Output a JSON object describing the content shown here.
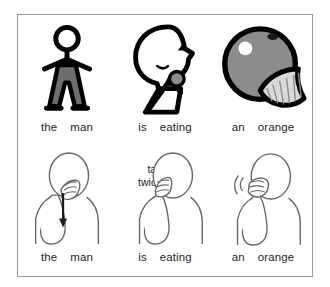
{
  "figure": {
    "border_color": "#9a9a9a",
    "background": "#ffffff"
  },
  "palette": {
    "ink": "#000000",
    "text": "#231f20",
    "body_fill": "#6e6e6e",
    "orange_fill": "#8c8c8c",
    "highlight": "#ffffff",
    "segment_fill": "#d9d9d9",
    "sign_line": "#6b6560"
  },
  "pictogram_row": {
    "cells": [
      {
        "name": "man-pictogram",
        "alt": "stick figure of a standing man with gray body"
      },
      {
        "name": "eating-pictogram",
        "alt": "profile head with open mouth and hand holding food"
      },
      {
        "name": "orange-pictogram",
        "alt": "gray round orange with highlight, stem and a cut segment"
      }
    ]
  },
  "sign_row": {
    "cells": [
      {
        "name": "sign-the-man",
        "alt": "hand stroking down the cheek with downward arrow",
        "note": ""
      },
      {
        "name": "sign-is-eating",
        "alt": "flat hand tapping at the mouth",
        "note_line1": "tap",
        "note_line2": "twice"
      },
      {
        "name": "sign-an-orange",
        "alt": "fist at the cheek with motion lines",
        "note": ""
      }
    ]
  },
  "captions": {
    "top": [
      {
        "words": [
          "the",
          "man"
        ]
      },
      {
        "words": [
          "is",
          "eating"
        ]
      },
      {
        "words": [
          "an",
          "orange"
        ]
      }
    ],
    "bottom": [
      {
        "words": [
          "the",
          "man"
        ]
      },
      {
        "words": [
          "is",
          "eating"
        ]
      },
      {
        "words": [
          "an",
          "orange"
        ]
      }
    ]
  }
}
